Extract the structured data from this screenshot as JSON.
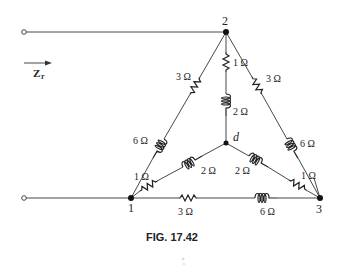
{
  "figure": {
    "caption": "FIG. 17.42",
    "input_label": "Z",
    "input_label_sub": "T"
  },
  "nodes": [
    {
      "id": "1",
      "label": "1"
    },
    {
      "id": "2",
      "label": "2"
    },
    {
      "id": "3",
      "label": "3"
    },
    {
      "id": "d",
      "label": "d"
    }
  ],
  "components": {
    "delta_left_resistor": {
      "type": "resistor",
      "value": "3 Ω",
      "from": "2",
      "to": "1"
    },
    "delta_left_inductor": {
      "type": "inductor",
      "value": "6 Ω",
      "from": "2",
      "to": "1"
    },
    "delta_right_resistor": {
      "type": "resistor",
      "value": "3 Ω",
      "from": "2",
      "to": "3"
    },
    "delta_right_inductor": {
      "type": "inductor",
      "value": "6 Ω",
      "from": "2",
      "to": "3"
    },
    "delta_bottom_resistor": {
      "type": "resistor",
      "value": "3 Ω",
      "from": "1",
      "to": "3"
    },
    "delta_bottom_inductor": {
      "type": "inductor",
      "value": "6 Ω",
      "from": "1",
      "to": "3"
    },
    "wye_top_resistor": {
      "type": "resistor",
      "value": "1 Ω",
      "from": "2",
      "to": "d"
    },
    "wye_top_inductor": {
      "type": "inductor",
      "value": "2 Ω",
      "from": "2",
      "to": "d"
    },
    "wye_left_resistor": {
      "type": "resistor",
      "value": "1 Ω",
      "from": "1",
      "to": "d"
    },
    "wye_left_inductor": {
      "type": "inductor",
      "value": "2 Ω",
      "from": "1",
      "to": "d"
    },
    "wye_right_resistor": {
      "type": "resistor",
      "value": "1 Ω",
      "from": "3",
      "to": "d"
    },
    "wye_right_inductor": {
      "type": "inductor",
      "value": "2 Ω",
      "from": "3",
      "to": "d"
    }
  }
}
